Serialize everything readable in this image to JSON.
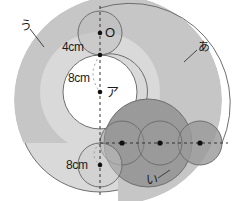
{
  "figure": {
    "colors": {
      "background": "#ffffff",
      "region_u_fill": "#d9d9d9",
      "region_a_fill": "#c6c6c6",
      "region_i_fill": "#9a9a9a",
      "inner_white": "#ffffff",
      "outline": "#6e6e6e",
      "dashed_line": "#333333",
      "text": "#1a1a1a",
      "dot": "#111111"
    },
    "labels": {
      "region_a": "あ",
      "region_i": "い",
      "region_u": "う",
      "point_o": "O",
      "point_a_kana": "ア",
      "dim_top": "4cm",
      "dim_middle": "8cm",
      "dim_bottom": "8cm"
    },
    "geometry": {
      "unit_note": "cm",
      "small_circle_radius": 4,
      "inner_circle_radius": 8,
      "lower_dim_radius": 8,
      "center_o": {
        "x": 100,
        "y": 33
      },
      "point_a": {
        "x": 100,
        "y": 92
      },
      "vertical_axis_x": 100,
      "horizontal_axis_y": 143,
      "row_circle_centers": [
        {
          "x": 122,
          "y": 143
        },
        {
          "x": 160,
          "y": 143
        },
        {
          "x": 200,
          "y": 143
        }
      ],
      "row_circle_radius": 22,
      "outer_big_circle": {
        "cx": 100,
        "cy": 110,
        "r": 82
      },
      "ring_a_outer": {
        "cx": 122,
        "cy": 100,
        "r": 100
      },
      "inner_white_circle": {
        "cx": 100,
        "cy": 92,
        "r": 37
      },
      "top_small_circle": {
        "cx": 100,
        "cy": 33,
        "r": 22
      },
      "bottom_small_circle": {
        "cx": 100,
        "cy": 165,
        "r": 22
      },
      "dark_lobe": {
        "cx": 148,
        "cy": 143,
        "r": 44
      }
    }
  }
}
